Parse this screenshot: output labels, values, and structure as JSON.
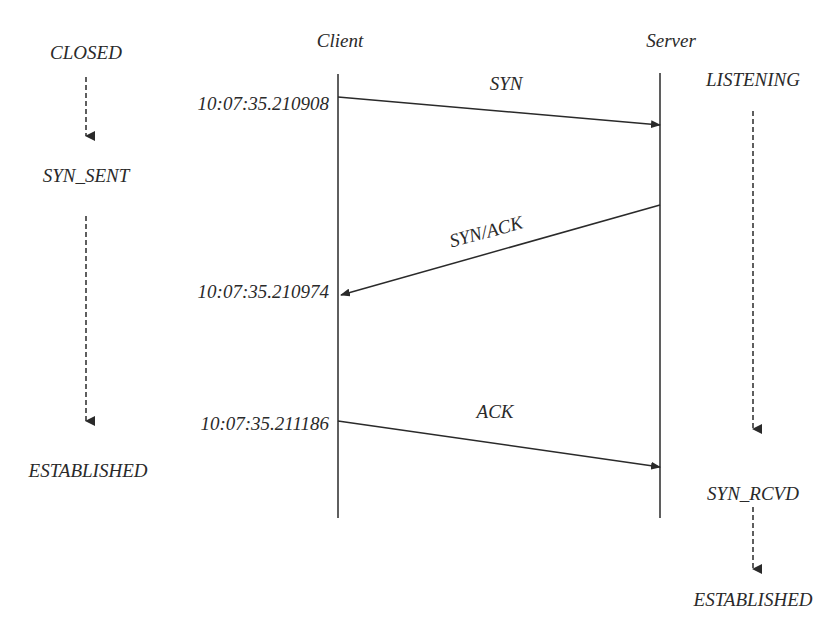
{
  "diagram": {
    "type": "sequence",
    "lifelines": {
      "client": "Client",
      "server": "Server"
    },
    "client_states": [
      "CLOSED",
      "SYN_SENT",
      "ESTABLISHED"
    ],
    "server_states": [
      "LISTENING",
      "SYN_RCVD",
      "ESTABLISHED"
    ],
    "messages": [
      {
        "label": "SYN",
        "from": "Client",
        "to": "Server",
        "timestamp": "10:07:35.210908"
      },
      {
        "label": "SYN/ACK",
        "from": "Server",
        "to": "Client",
        "timestamp": "10:07:35.210974"
      },
      {
        "label": "ACK",
        "from": "Client",
        "to": "Server",
        "timestamp": "10:07:35.211186"
      }
    ],
    "colors": {
      "line": "#2a2a2a",
      "text": "#2a2a2a",
      "background": "#ffffff"
    }
  }
}
